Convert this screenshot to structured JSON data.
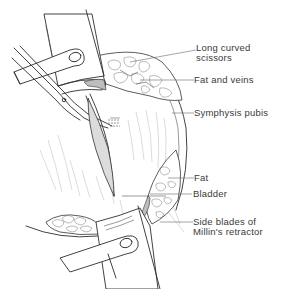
{
  "figure": {
    "colors": {
      "ink": "#2e2e2e",
      "label_text": "#3a3a3a",
      "leader_line": "#6a6a6a",
      "shading": "#bdbdbd",
      "background": "#ffffff"
    }
  },
  "labels": [
    {
      "id": "long-curved-scissors",
      "line1": "Long curved",
      "line2": "scissors"
    },
    {
      "id": "fat-and-veins",
      "line1": "Fat and veins"
    },
    {
      "id": "symphysis-pubis",
      "line1": "Symphysis pubis"
    },
    {
      "id": "fat",
      "line1": "Fat"
    },
    {
      "id": "bladder",
      "line1": "Bladder"
    },
    {
      "id": "side-blades",
      "line1": "Side blades of",
      "line2": "Millin's retractor"
    }
  ]
}
